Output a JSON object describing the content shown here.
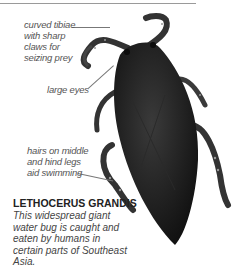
{
  "annotations": [
    {
      "id": "tibiae",
      "text": "curved tibiae with sharp claws for seizing prey",
      "lines": [
        "curved tibiae",
        "with sharp",
        "claws for",
        "seizing prey"
      ]
    },
    {
      "id": "eyes",
      "text": "large eyes",
      "lines": [
        "large eyes"
      ]
    },
    {
      "id": "hairs",
      "text": "hairs on middle and hind legs aid swimming",
      "lines": [
        "hairs on middle",
        "and hind legs",
        "aid swimming"
      ]
    }
  ],
  "species": {
    "name": "LETHOCERUS GRANDIS",
    "description": "This widespread giant water bug is caught and eaten by humans in certain parts of Southeast Asia."
  },
  "colors": {
    "rule": "#9a9a9a",
    "text": "#444444",
    "bug_body": "#1e1e1e"
  }
}
